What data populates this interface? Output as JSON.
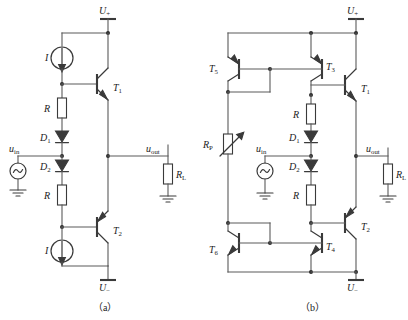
{
  "figure": {
    "caption_a": "（a）",
    "caption_b": "（b）",
    "line_color": "#5a5a5a",
    "device_color": "#3a3a3a"
  },
  "circuit_a": {
    "name": "(a)",
    "rails": {
      "positive": "U",
      "positive_sub": "+",
      "negative": "U",
      "negative_sub": "−"
    },
    "sources": [
      {
        "id": "I-top",
        "label": "I",
        "type": "current-source"
      },
      {
        "id": "I-bottom",
        "label": "I",
        "type": "current-source"
      },
      {
        "id": "uin",
        "label": "u",
        "label_sub": "in",
        "type": "ac-voltage-source"
      }
    ],
    "resistors": [
      {
        "id": "R-top",
        "label": "R"
      },
      {
        "id": "R-bottom",
        "label": "R"
      },
      {
        "id": "RL",
        "label": "R",
        "label_sub": "L"
      }
    ],
    "diodes": [
      {
        "id": "D1",
        "label": "D",
        "label_sub": "1"
      },
      {
        "id": "D2",
        "label": "D",
        "label_sub": "2"
      }
    ],
    "transistors": [
      {
        "id": "T1",
        "label": "T",
        "label_sub": "1",
        "type": "npn"
      },
      {
        "id": "T2",
        "label": "T",
        "label_sub": "2",
        "type": "pnp"
      }
    ],
    "ports": [
      {
        "id": "uin",
        "label": "u",
        "label_sub": "in"
      },
      {
        "id": "uout",
        "label": "u",
        "label_sub": "out"
      }
    ]
  },
  "circuit_b": {
    "name": "(b)",
    "rails": {
      "positive": "U",
      "positive_sub": "+",
      "negative": "U",
      "negative_sub": "−"
    },
    "sources": [
      {
        "id": "uin",
        "label": "u",
        "label_sub": "in",
        "type": "ac-voltage-source"
      }
    ],
    "resistors": [
      {
        "id": "RP",
        "label": "R",
        "label_sub": "P",
        "type": "potentiometer"
      },
      {
        "id": "R-top",
        "label": "R"
      },
      {
        "id": "R-bottom",
        "label": "R"
      },
      {
        "id": "RL",
        "label": "R",
        "label_sub": "L"
      }
    ],
    "diodes": [
      {
        "id": "D1",
        "label": "D",
        "label_sub": "1"
      },
      {
        "id": "D2",
        "label": "D",
        "label_sub": "2"
      }
    ],
    "transistors": [
      {
        "id": "T5",
        "label": "T",
        "label_sub": "5",
        "type": "pnp"
      },
      {
        "id": "T3",
        "label": "T",
        "label_sub": "3",
        "type": "pnp"
      },
      {
        "id": "T1",
        "label": "T",
        "label_sub": "1",
        "type": "npn"
      },
      {
        "id": "T6",
        "label": "T",
        "label_sub": "6",
        "type": "npn"
      },
      {
        "id": "T4",
        "label": "T",
        "label_sub": "4",
        "type": "npn"
      },
      {
        "id": "T2",
        "label": "T",
        "label_sub": "2",
        "type": "pnp"
      }
    ],
    "ports": [
      {
        "id": "uin",
        "label": "u",
        "label_sub": "in"
      },
      {
        "id": "uout",
        "label": "u",
        "label_sub": "out"
      }
    ]
  }
}
